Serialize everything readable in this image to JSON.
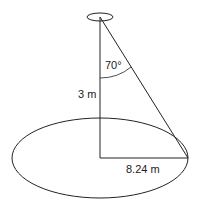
{
  "diagram": {
    "type": "cone-geometry",
    "labels": {
      "height": "3 m",
      "angle": "70°",
      "radius": "8.24 m"
    },
    "colors": {
      "stroke": "#222222",
      "background": "#ffffff"
    }
  }
}
